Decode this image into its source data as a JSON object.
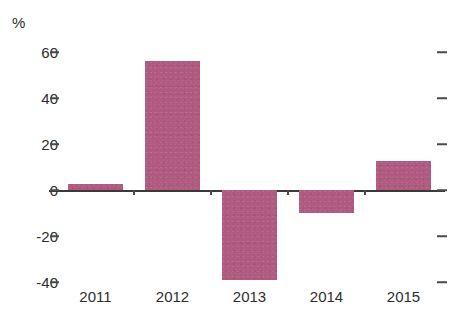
{
  "chart_data": {
    "type": "bar",
    "title": "",
    "subtitle": "",
    "xlabel": "",
    "ylabel": "%",
    "unit_label": "%",
    "categories": [
      "2011",
      "2012",
      "2013",
      "2014",
      "2015"
    ],
    "values": [
      2.5,
      56,
      -39,
      -10,
      12.5
    ],
    "series": [
      {
        "name": "",
        "values": [
          2.5,
          56,
          -39,
          -10,
          12.5
        ]
      }
    ],
    "ylim": [
      -45,
      65
    ],
    "yticks": [
      60,
      40,
      20,
      0,
      -20,
      -40
    ],
    "ytick_labels": [
      "60",
      "40",
      "20",
      "0",
      "-20",
      "-40"
    ],
    "grid": false,
    "legend": null,
    "bar_color": "#af5a7e",
    "axis_color": "#3a3a3a",
    "text_color": "#2e2e2e"
  },
  "axis": {
    "y_unit": "%",
    "ticks": [
      {
        "label": "60",
        "value": 60
      },
      {
        "label": "40",
        "value": 40
      },
      {
        "label": "20",
        "value": 20
      },
      {
        "label": "0",
        "value": 0
      },
      {
        "label": "-20",
        "value": -20
      },
      {
        "label": "-40",
        "value": -40
      }
    ]
  },
  "bars": [
    {
      "category": "2011",
      "value": 2.5
    },
    {
      "category": "2012",
      "value": 56
    },
    {
      "category": "2013",
      "value": -39
    },
    {
      "category": "2014",
      "value": -10
    },
    {
      "category": "2015",
      "value": 12.5
    }
  ]
}
